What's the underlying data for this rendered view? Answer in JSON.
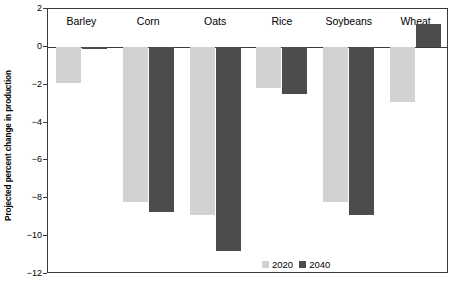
{
  "chart_data": {
    "type": "bar",
    "title": "",
    "subtitle": "",
    "xlabel": "",
    "ylabel": "Projected percent change in production",
    "categories": [
      "Barley",
      "Corn",
      "Oats",
      "Rice",
      "Soybeans",
      "Wheat"
    ],
    "series": [
      {
        "name": "2020",
        "color": "#d2d2d2",
        "values": [
          -1.9,
          -8.2,
          -8.9,
          -2.2,
          -8.2,
          -2.9
        ]
      },
      {
        "name": "2040",
        "color": "#4c4c4c",
        "values": [
          -0.1,
          -8.7,
          -10.8,
          -2.5,
          -8.9,
          1.2
        ]
      }
    ],
    "ylim": [
      -12,
      2
    ],
    "yticks": [
      2,
      0,
      -2,
      -4,
      -6,
      -8,
      -10,
      -12
    ],
    "ytick_labels": [
      "2",
      "0",
      "−2",
      "−4",
      "−6",
      "−8",
      "−10",
      "−12"
    ],
    "grid": false,
    "legend_position": "inside-bottom-right",
    "legend_entries": [
      "2020",
      "2040"
    ],
    "axis_color": "#3a3a3a",
    "background_color": "#ffffff"
  }
}
